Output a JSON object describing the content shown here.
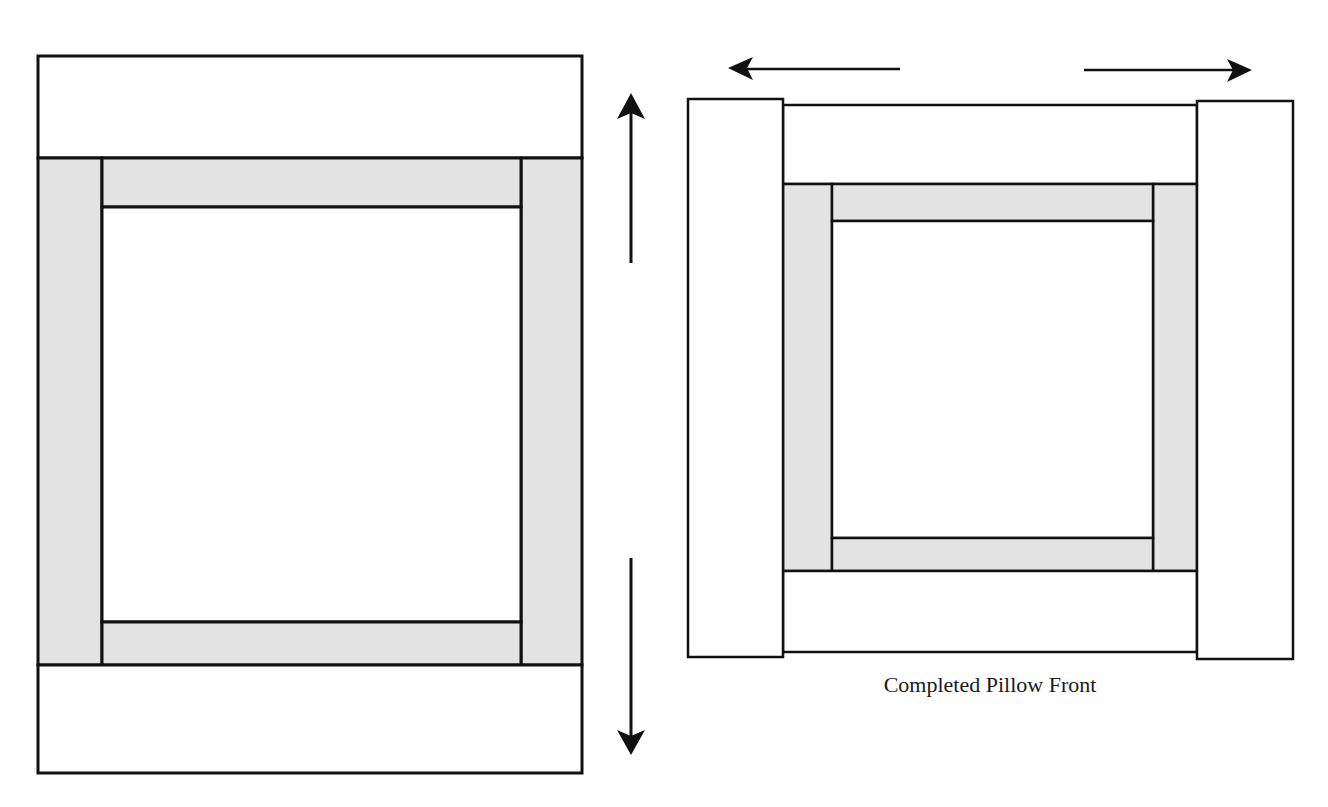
{
  "caption": "Completed Pillow Front",
  "colors": {
    "stroke": "#111111",
    "sashing_fill": "#e3e3e3",
    "background": "#ffffff",
    "band_fill": "#ffffff"
  },
  "left_diagram": {
    "description": "Pillow front with top and bottom borders being added (vertical arrows)",
    "arrows": [
      "up",
      "down"
    ]
  },
  "right_diagram": {
    "description": "Pillow front with left and right borders added (horizontal arrows)",
    "arrows": [
      "left",
      "right"
    ]
  }
}
